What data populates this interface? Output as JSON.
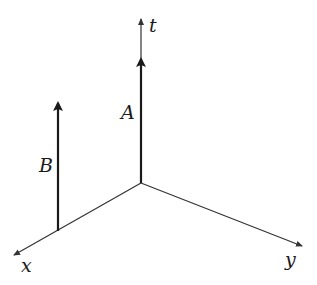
{
  "diagram": {
    "type": "spacetime-axes",
    "colors": {
      "ink": "#1a1a1a",
      "axis": "#333333",
      "background": "#ffffff"
    },
    "origin": {
      "x": 141,
      "y": 183
    },
    "axes": {
      "t": {
        "label": "t",
        "tip": {
          "x": 141,
          "y": 18
        }
      },
      "x": {
        "label": "x",
        "tip": {
          "x": 13,
          "y": 256
        }
      },
      "y": {
        "label": "y",
        "tip": {
          "x": 303,
          "y": 246
        }
      }
    },
    "worldlines": [
      {
        "label": "A",
        "base": {
          "x": 141,
          "y": 183
        },
        "tip": {
          "x": 141,
          "y": 57
        }
      },
      {
        "label": "B",
        "base": {
          "x": 58,
          "y": 231
        },
        "tip": {
          "x": 58,
          "y": 101
        }
      }
    ]
  }
}
